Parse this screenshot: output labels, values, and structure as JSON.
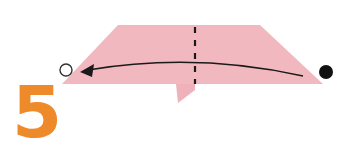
{
  "diagram": {
    "type": "origami-instruction-step",
    "step_number": "5",
    "colors": {
      "paper": "#f2b8c0",
      "paper_shadow": "#e9a9b3",
      "step_number": "#ee8a2a",
      "lines": "#1a1a1a",
      "background": "#ffffff"
    },
    "elements": {
      "paper": "trapezoid-folded-paper",
      "fold_line": "vertical-dashed-valley-fold",
      "arrow": "curved-arrow-right-to-left",
      "start_marker": "filled-dot",
      "end_marker": "hollow-circle",
      "flap": "small-pointed-flap-below"
    }
  }
}
